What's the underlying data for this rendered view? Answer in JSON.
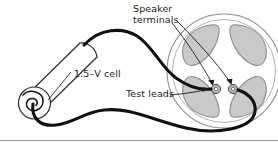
{
  "figure": {
    "width": 278,
    "height": 143,
    "background": "#ffffff"
  },
  "labels": {
    "speaker_terminals_line1": "Speaker",
    "speaker_terminals_line2": "terminals",
    "cell": "1.5–V cell",
    "test_leads": "Test leads"
  },
  "colors": {
    "ink": "#1a1a1a",
    "wire": "#111111",
    "petal_fill": "#c9c9c9",
    "petal_stroke": "#8e8e8e",
    "speaker_ring": "#8e8e8e",
    "battery_fill": "#ffffff",
    "battery_stroke": "#2b2b2b",
    "terminal_fill": "#b0b0b0",
    "terminal_stroke": "#4a4a4a",
    "border": "#9a9a9a"
  },
  "components": {
    "battery": {
      "name": "1.5-V dry cell",
      "voltage": "1.5 V",
      "shape": "cylinder"
    },
    "speaker": {
      "name": "loudspeaker",
      "shape": "circular",
      "petal_count": 4
    },
    "terminals": {
      "count": 2,
      "names": [
        "left-terminal",
        "right-terminal"
      ]
    },
    "leads": {
      "count": 2,
      "names": [
        "top-lead",
        "bottom-lead"
      ]
    },
    "coil": {
      "name": "wire-coil-spiral",
      "turns": 2
    }
  },
  "annotations": {
    "arrows": [
      {
        "name": "speaker-terminals-arrow-left",
        "points_to": "left-terminal"
      },
      {
        "name": "speaker-terminals-arrow-right",
        "points_to": "right-terminal"
      },
      {
        "name": "test-leads-arrow",
        "points_to": "left-terminal-lead"
      },
      {
        "name": "cell-leader-line",
        "points_to": "battery"
      }
    ]
  }
}
